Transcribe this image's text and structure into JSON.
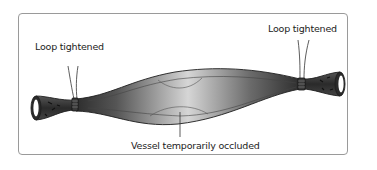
{
  "figure": {
    "labels": {
      "left_tie": "Loop tightened",
      "right_tie": "Loop tightened",
      "vessel": "Vessel temporarily occluded"
    },
    "colors": {
      "frame": "#9a9a9a",
      "vessel_dark": "#3a3a3a",
      "vessel_light": "#d4d4d4",
      "outline": "#1e1e1e",
      "text": "#222222"
    }
  }
}
